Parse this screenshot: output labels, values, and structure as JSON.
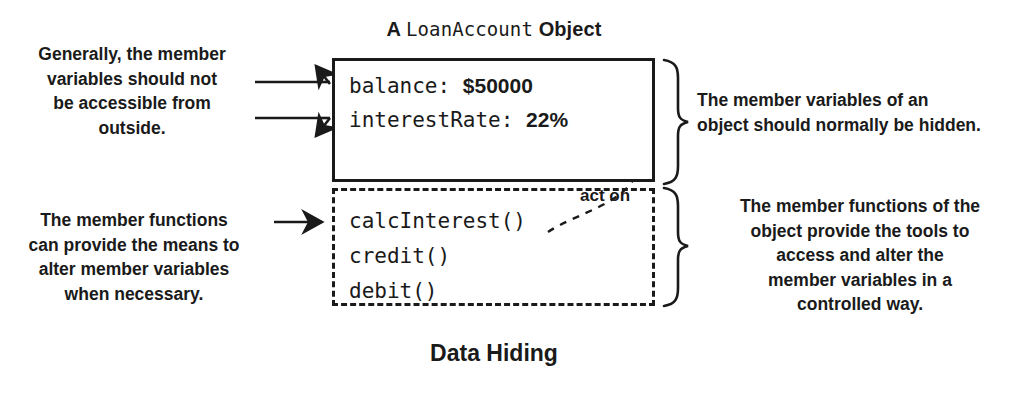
{
  "diagram": {
    "caption": "Data Hiding",
    "object_title": {
      "prefix": "A",
      "class_name": "LoanAccount",
      "suffix": "Object"
    },
    "member_variables_box": {
      "style": "solid",
      "members": [
        {
          "name": "balance:",
          "value": "$50000"
        },
        {
          "name": "interestRate:",
          "value": "22%"
        }
      ]
    },
    "member_functions_box": {
      "style": "dashed",
      "functions": [
        {
          "name": "calcInterest()"
        },
        {
          "name": "credit()"
        },
        {
          "name": "debit()"
        }
      ]
    },
    "relation_label": "act on",
    "annotations": {
      "left_top": [
        "Generally, the member",
        "variables should not",
        "be accessible from",
        "outside."
      ],
      "left_bottom": [
        "The member functions",
        "can provide the means to",
        "alter member variables",
        "when necessary."
      ],
      "right_top": [
        "The member variables of an",
        "object should normally be hidden."
      ],
      "right_bottom": [
        "The member functions of the",
        "object provide the tools to",
        "access and alter the",
        "member variables in a",
        "controlled way."
      ]
    },
    "colors": {
      "ink": "#1a1a1a",
      "background": "#ffffff"
    }
  }
}
